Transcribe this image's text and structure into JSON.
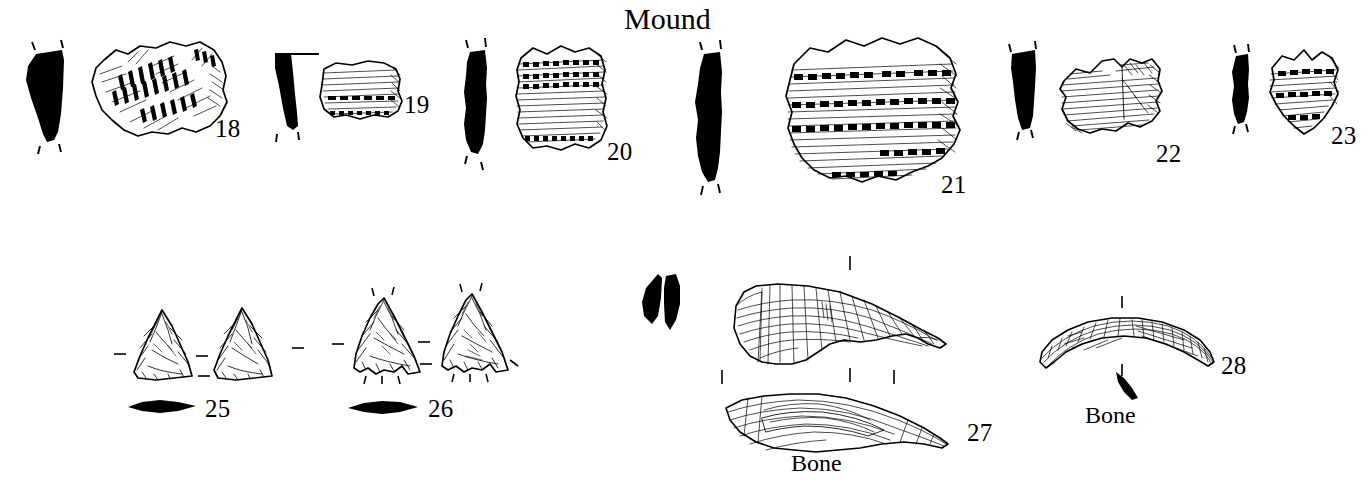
{
  "plate": {
    "title": "Mound",
    "title_pos": {
      "x": 624,
      "y": 4
    },
    "background": "#ffffff",
    "ink_color": "#000000",
    "width": 1368,
    "height": 495,
    "description": "Archaeological artifact plate: ceramic rim sherds with profiles, chipped-stone triangular projectile points, and bone tools"
  },
  "rows": [
    {
      "name": "ceramics-row",
      "artifacts": [
        {
          "number": "18",
          "kind": "ceramic-sherd",
          "has_profile": true,
          "surface": "cord-marked with diagonal herringbone incised bands",
          "number_pos": {
            "x": 215,
            "y": 116
          },
          "profile_pos": {
            "x": 14,
            "y": 42
          },
          "sherd_pos": {
            "x": 82,
            "y": 36
          }
        },
        {
          "number": "19",
          "kind": "ceramic-sherd",
          "has_profile": true,
          "surface": "horizontal cord-marked with punctate row",
          "number_pos": {
            "x": 404,
            "y": 92
          },
          "profile_pos": {
            "x": 265,
            "y": 50
          },
          "sherd_pos": {
            "x": 312,
            "y": 57
          }
        },
        {
          "number": "20",
          "kind": "ceramic-sherd",
          "has_profile": true,
          "surface": "cord-marked with dentate punctate rows",
          "number_pos": {
            "x": 607,
            "y": 139
          },
          "profile_pos": {
            "x": 455,
            "y": 44
          },
          "sherd_pos": {
            "x": 508,
            "y": 44
          }
        },
        {
          "number": "21",
          "kind": "ceramic-sherd",
          "has_profile": true,
          "surface": "banded cord-marking with dentate punctate rows",
          "number_pos": {
            "x": 941,
            "y": 172
          },
          "profile_pos": {
            "x": 686,
            "y": 48
          },
          "sherd_pos": {
            "x": 775,
            "y": 33
          }
        },
        {
          "number": "22",
          "kind": "ceramic-sherd",
          "has_profile": true,
          "surface": "horizontal cord-marked",
          "number_pos": {
            "x": 1156,
            "y": 141
          },
          "profile_pos": {
            "x": 1006,
            "y": 44
          },
          "sherd_pos": {
            "x": 1056,
            "y": 51
          }
        },
        {
          "number": "23",
          "kind": "ceramic-sherd",
          "has_profile": true,
          "surface": "cord-marked with dentate punctate rows",
          "number_pos": {
            "x": 1331,
            "y": 123
          },
          "profile_pos": {
            "x": 1227,
            "y": 48
          },
          "sherd_pos": {
            "x": 1258,
            "y": 46
          }
        }
      ]
    },
    {
      "name": "points-and-bone-row",
      "artifacts": [
        {
          "number": "25",
          "kind": "projectile-point",
          "views": 2,
          "cross_section": "lenticular",
          "base": "straight",
          "number_pos": {
            "x": 205,
            "y": 396
          },
          "obverse_pos": {
            "x": 140,
            "y": 310
          },
          "reverse_pos": {
            "x": 210,
            "y": 305
          },
          "section_pos": {
            "x": 128,
            "y": 399
          }
        },
        {
          "number": "26",
          "kind": "projectile-point",
          "views": 2,
          "cross_section": "lenticular",
          "base": "concave notched",
          "number_pos": {
            "x": 428,
            "y": 396
          },
          "obverse_pos": {
            "x": 358,
            "y": 292
          },
          "reverse_pos": {
            "x": 438,
            "y": 288
          },
          "section_pos": {
            "x": 348,
            "y": 399
          }
        },
        {
          "number": "27",
          "kind": "bone-tool",
          "material_label": "Bone",
          "views": 2,
          "has_profile": true,
          "number_pos": {
            "x": 967,
            "y": 420
          },
          "profile_pos": {
            "x": 638,
            "y": 272
          },
          "upper_view_pos": {
            "x": 726,
            "y": 278
          },
          "lower_view_pos": {
            "x": 722,
            "y": 393
          },
          "material_label_pos": {
            "x": 791,
            "y": 451
          }
        },
        {
          "number": "28",
          "kind": "bone-tool",
          "material_label": "Bone",
          "views": 1,
          "has_profile": true,
          "number_pos": {
            "x": 1221,
            "y": 353
          },
          "view_pos": {
            "x": 1036,
            "y": 313
          },
          "section_pos": {
            "x": 1122,
            "y": 371
          },
          "material_label_pos": {
            "x": 1085,
            "y": 403
          }
        }
      ]
    }
  ],
  "material_labels": [
    "Bone",
    "Bone"
  ],
  "artifact_numbers": [
    "18",
    "19",
    "20",
    "21",
    "22",
    "23",
    "25",
    "26",
    "27",
    "28"
  ]
}
